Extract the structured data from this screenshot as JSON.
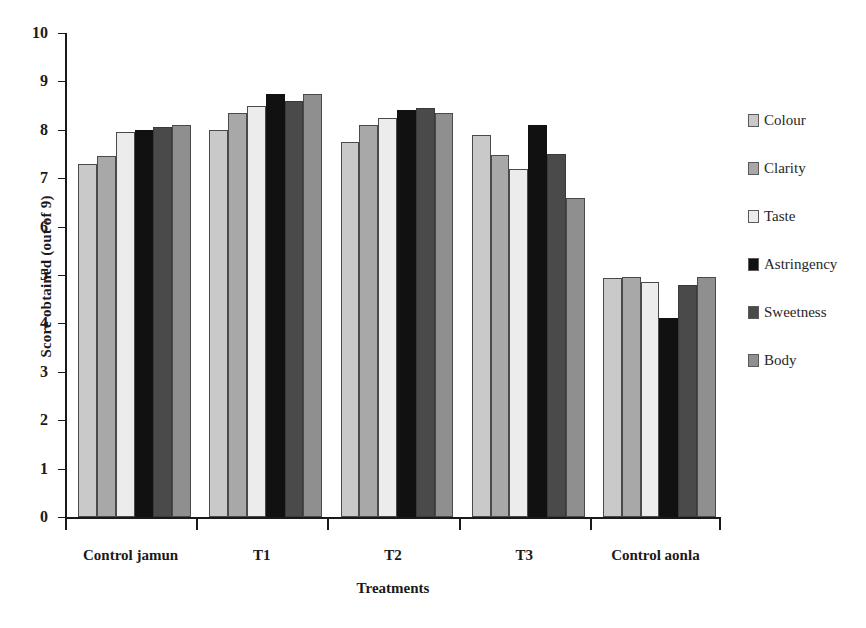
{
  "chart_data": {
    "type": "bar",
    "title": "",
    "xlabel": "Treatments",
    "ylabel": "Score obtained (out of 9)",
    "categories": [
      "Control jamun",
      "T1",
      "T2",
      "T3",
      "Control aonla"
    ],
    "ylim": [
      0,
      10
    ],
    "yticks": [
      0,
      1,
      2,
      3,
      4,
      5,
      6,
      7,
      8,
      9,
      10
    ],
    "ytick_labels": [
      "0",
      "1",
      "2",
      "3",
      "4",
      "5",
      "6",
      "7",
      "8",
      "9",
      "10"
    ],
    "grid": false,
    "legend_position": "right",
    "series": [
      {
        "name": "Colour",
        "color": "#c9c9c9",
        "values": [
          7.3,
          8.0,
          7.75,
          7.9,
          4.93
        ]
      },
      {
        "name": "Clarity",
        "color": "#a8a8a8",
        "values": [
          7.45,
          8.35,
          8.1,
          7.48,
          4.95
        ]
      },
      {
        "name": "Taste",
        "color": "#ececec",
        "values": [
          7.95,
          8.5,
          8.25,
          7.2,
          4.85
        ]
      },
      {
        "name": "Astringency",
        "color": "#111111",
        "values": [
          8.0,
          8.75,
          8.4,
          8.1,
          4.12
        ]
      },
      {
        "name": "Sweetness",
        "color": "#4a4a4a",
        "values": [
          8.05,
          8.6,
          8.45,
          7.5,
          4.8
        ]
      },
      {
        "name": "Body",
        "color": "#8f8f8f",
        "values": [
          8.1,
          8.75,
          8.35,
          6.6,
          4.95
        ]
      }
    ]
  },
  "axes": {
    "y_title": "Score obtained (out of 9)",
    "x_title": "Treatments"
  },
  "legend": {
    "items": [
      {
        "label": "Colour"
      },
      {
        "label": "Clarity"
      },
      {
        "label": "Taste"
      },
      {
        "label": "Astringency"
      },
      {
        "label": "Sweetness"
      },
      {
        "label": "Body"
      }
    ]
  }
}
